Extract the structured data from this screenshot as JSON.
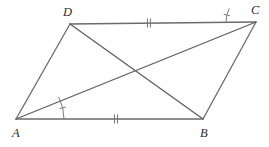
{
  "figure": {
    "kind": "geometry-diagram",
    "shape_name": "parallelogram",
    "canvas": {
      "width": 269,
      "height": 147,
      "background": "#ffffff"
    },
    "colors": {
      "stroke": "#6b6b6b",
      "diagonal_stroke": "#5e5e5e",
      "mark_stroke": "#7a7a7a",
      "label_fill": "#2b2b2b"
    },
    "stroke_width": 1.3,
    "vertices": [
      {
        "id": "A",
        "label": "A",
        "x": 16,
        "y": 119,
        "label_x": 12,
        "label_y": 137
      },
      {
        "id": "B",
        "label": "B",
        "x": 203,
        "y": 119,
        "label_x": 200,
        "label_y": 137
      },
      {
        "id": "C",
        "label": "C",
        "x": 256,
        "y": 22,
        "label_x": 251,
        "label_y": 14
      },
      {
        "id": "D",
        "label": "D",
        "x": 70,
        "y": 24,
        "label_x": 63,
        "label_y": 16
      }
    ],
    "sides": [
      {
        "id": "AB",
        "from": "A",
        "to": "B",
        "tick_marks": 2
      },
      {
        "id": "BC",
        "from": "B",
        "to": "C",
        "tick_marks": 0
      },
      {
        "id": "CD",
        "from": "C",
        "to": "D",
        "tick_marks": 2
      },
      {
        "id": "DA",
        "from": "D",
        "to": "A",
        "tick_marks": 0
      }
    ],
    "diagonals": [
      {
        "id": "AC",
        "from": "A",
        "to": "C"
      },
      {
        "id": "BD",
        "from": "B",
        "to": "D"
      }
    ],
    "diagonal_intersection": {
      "x": 140,
      "y": 75
    },
    "tick_marks": [
      {
        "id": "tick-AB",
        "on": "AB",
        "x": 116,
        "y": 119,
        "count": 2,
        "length": 9,
        "angle_deg": 0
      },
      {
        "id": "tick-CD",
        "on": "CD",
        "x": 149,
        "y": 23,
        "count": 2,
        "length": 9,
        "angle_deg": 0
      }
    ],
    "angle_arcs": [
      {
        "id": "angle-BAC",
        "at": "A",
        "between": [
          "AB",
          "AC"
        ],
        "radius": 48,
        "start_deg": -27,
        "end_deg": 0,
        "has_tick": true
      },
      {
        "id": "angle-DCA",
        "at": "C",
        "between": [
          "CD",
          "CA"
        ],
        "radius": 30,
        "start_deg": 180,
        "end_deg": 207,
        "has_tick": true
      }
    ],
    "labels": {
      "A": "A",
      "B": "B",
      "C": "C",
      "D": "D"
    }
  }
}
